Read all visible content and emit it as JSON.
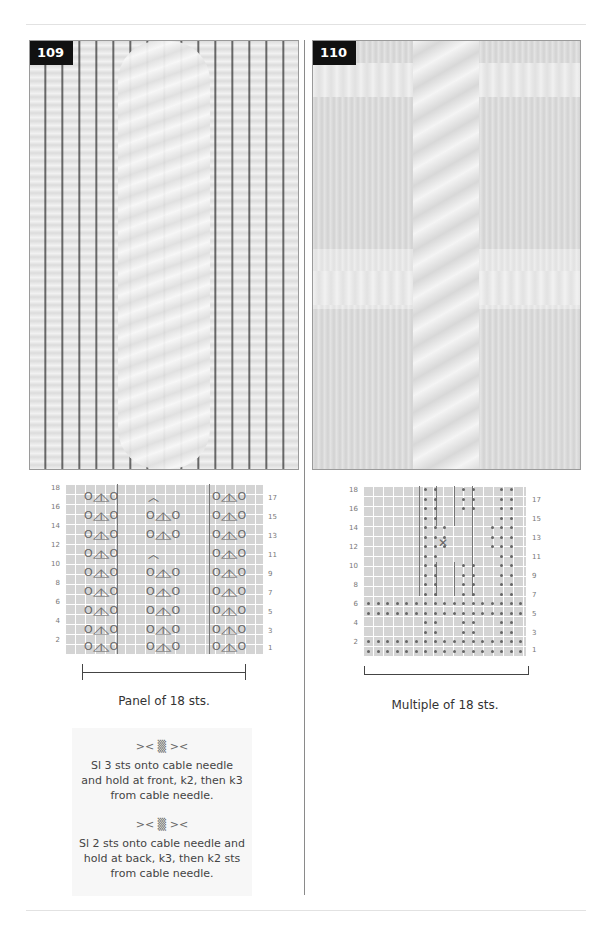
{
  "page": {
    "background": "#ffffff",
    "rule_color": "#e2e2e2",
    "divider_color": "#8a8a8a"
  },
  "patterns": [
    {
      "number": "109",
      "photo_alt": "knitted lace cable panel swatch",
      "chart": {
        "row_numbers_left": [
          "18",
          "16",
          "14",
          "12",
          "10",
          "8",
          "6",
          "4",
          "2"
        ],
        "row_numbers_right": [
          "17",
          "15",
          "13",
          "11",
          "9",
          "7",
          "5",
          "3",
          "1"
        ],
        "symbol_group": "O◿◺O",
        "symbols_legend": [
          "yarn-over",
          "k2tog",
          "ssk",
          "yarn-over"
        ]
      },
      "caption": "Panel of 18 sts.",
      "key": [
        {
          "icon": "cable-front-3-2-icon",
          "glyph": ">< ▒ ><",
          "text": "Sl 3 sts onto cable needle and hold at front, k2, then k3 from cable needle."
        },
        {
          "icon": "cable-back-2-3-icon",
          "glyph": ">< ▒ ><",
          "text": "Sl 2 sts onto cable needle and hold at back, k3, then k2 sts from cable needle."
        }
      ]
    },
    {
      "number": "110",
      "photo_alt": "knitted cable and garter grid swatch",
      "chart": {
        "row_numbers_left": [
          "18",
          "16",
          "14",
          "12",
          "10",
          "8",
          "6",
          "4",
          "2"
        ],
        "row_numbers_right": [
          "17",
          "15",
          "13",
          "11",
          "9",
          "7",
          "5",
          "3",
          "1"
        ],
        "symbol": "purl-dot"
      },
      "caption": "Multiple of 18 sts."
    }
  ]
}
